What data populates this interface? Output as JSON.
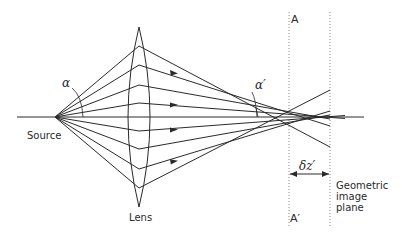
{
  "diagram": {
    "labels": {
      "source": "Source",
      "lens": "Lens",
      "alpha": "α",
      "alpha_prime": "α′",
      "plane_a_top": "A",
      "plane_a_bottom": "A′",
      "delta_z": "δz′",
      "geometric_image_plane_line1": "Geometric",
      "geometric_image_plane_line2": "image",
      "geometric_image_plane_line3": "plane"
    },
    "colors": {
      "line": "#2a2a2a",
      "dotted": "#8a8a8a",
      "background": "#ffffff"
    },
    "geometry": {
      "source_point": [
        55,
        117
      ],
      "axis": {
        "x_start": 17,
        "x_end": 364,
        "y": 117
      },
      "lens": {
        "center_x": 139,
        "top_y": 27,
        "bottom_y": 207,
        "half_width": 11
      },
      "plane_A_x": 289,
      "image_plane_x": 330,
      "ray_lens_heights": [
        46,
        65,
        85,
        103,
        131,
        149,
        169,
        188
      ],
      "delta_z_arrow_y": 174
    }
  }
}
